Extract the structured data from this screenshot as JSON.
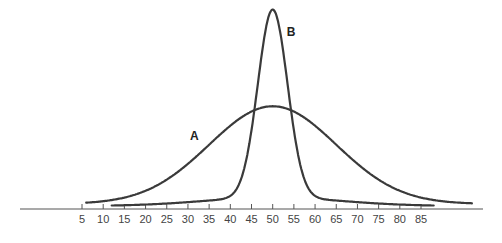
{
  "chart_data": {
    "type": "line",
    "title": "",
    "xlabel": "",
    "ylabel": "",
    "xlim": [
      -10,
      100
    ],
    "ylim": [
      0,
      1
    ],
    "grid": false,
    "legend": "none",
    "x_ticks": [
      5,
      10,
      15,
      20,
      25,
      30,
      35,
      40,
      45,
      50,
      55,
      60,
      65,
      70,
      75,
      80,
      85
    ],
    "series": [
      {
        "name": "A",
        "label": "A",
        "distribution": "normal",
        "mean": 50,
        "sd": 15,
        "relative_peak": 0.52,
        "x_range": [
          6,
          97
        ]
      },
      {
        "name": "B",
        "label": "B",
        "distribution": "normal",
        "mean": 50,
        "sd": 3.5,
        "relative_peak": 1.0,
        "baseline_tail": true,
        "x_range": [
          12,
          88
        ]
      }
    ],
    "annotations": [
      {
        "text": "A",
        "near_series": "A",
        "position": "left-shoulder"
      },
      {
        "text": "B",
        "near_series": "B",
        "position": "right-of-peak"
      }
    ]
  }
}
